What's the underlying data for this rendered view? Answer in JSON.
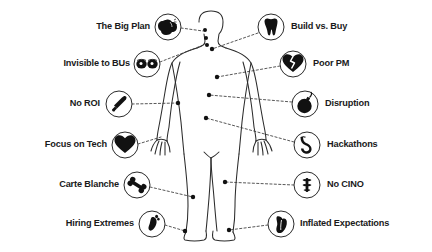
{
  "diagram": {
    "style": {
      "background": "#ffffff",
      "ink": "#1a1a1a",
      "body_outline": "#2b2b2b",
      "connector": "#3a3a3a",
      "icon_fill": "#111111",
      "icon_ring": "#2b2b2b"
    },
    "body": {
      "name": "human-figure-silhouette",
      "anchor_points": [
        {
          "id": "head-top",
          "x": 205,
          "y": 30
        },
        {
          "id": "head-mid",
          "x": 206,
          "y": 38
        },
        {
          "id": "head-low",
          "x": 207,
          "y": 46
        },
        {
          "id": "neck",
          "x": 212,
          "y": 48
        },
        {
          "id": "chest-left",
          "x": 217,
          "y": 76
        },
        {
          "id": "chest-right",
          "x": 208,
          "y": 95
        },
        {
          "id": "abdomen",
          "x": 205,
          "y": 117
        },
        {
          "id": "arm-left",
          "x": 179,
          "y": 103
        },
        {
          "id": "hip",
          "x": 224,
          "y": 182
        },
        {
          "id": "knee-left",
          "x": 194,
          "y": 197
        },
        {
          "id": "ankle-left",
          "x": 186,
          "y": 231
        },
        {
          "id": "ankle-right",
          "x": 228,
          "y": 230
        }
      ]
    },
    "items_left": [
      {
        "id": "the-big-plan",
        "label": "The Big Plan",
        "icon": "brain-icon",
        "icon_cx": 168,
        "icon_cy": 27,
        "label_x": 150,
        "label_y": 23,
        "anchor": "head-top"
      },
      {
        "id": "invisible-to-bus",
        "label": "Invisible to BUs",
        "icon": "eyes-icon",
        "icon_cx": 147,
        "icon_cy": 64,
        "label_x": 130,
        "label_y": 60,
        "anchor": "head-low"
      },
      {
        "id": "no-roi",
        "label": "No ROI",
        "icon": "bone-pen-icon",
        "icon_cx": 119,
        "icon_cy": 104,
        "label_x": 100,
        "label_y": 100,
        "anchor": "arm-left"
      },
      {
        "id": "focus-on-tech",
        "label": "Focus on Tech",
        "icon": "heart-icon",
        "icon_cx": 125,
        "icon_cy": 145,
        "label_x": 106,
        "label_y": 141,
        "anchor": "hand-left"
      },
      {
        "id": "carte-blanche",
        "label": "Carte Blanche",
        "icon": "bone-icon",
        "icon_cx": 137,
        "icon_cy": 185,
        "label_x": 118,
        "label_y": 181,
        "anchor": "knee-left"
      },
      {
        "id": "hiring-extremes",
        "label": "Hiring Extremes",
        "icon": "footprint-icon",
        "icon_cx": 152,
        "icon_cy": 224,
        "label_x": 133,
        "label_y": 220,
        "anchor": "ankle-left"
      }
    ],
    "items_right": [
      {
        "id": "build-vs-buy",
        "label": "Build vs. Buy",
        "icon": "tooth-icon",
        "icon_cx": 271,
        "icon_cy": 27,
        "label_x": 291,
        "label_y": 23,
        "anchor": "head-mid"
      },
      {
        "id": "poor-pm",
        "label": "Poor PM",
        "icon": "broken-heart-icon",
        "icon_cx": 293,
        "icon_cy": 64,
        "label_x": 313,
        "label_y": 60,
        "anchor": "chest-left"
      },
      {
        "id": "disruption",
        "label": "Disruption",
        "icon": "bomb-icon",
        "icon_cx": 305,
        "icon_cy": 104,
        "label_x": 325,
        "label_y": 100,
        "anchor": "chest-right"
      },
      {
        "id": "hackathons",
        "label": "Hackathons",
        "icon": "stomach-icon",
        "icon_cx": 307,
        "icon_cy": 145,
        "label_x": 327,
        "label_y": 141,
        "anchor": "abdomen"
      },
      {
        "id": "no-cino",
        "label": "No CINO",
        "icon": "spine-icon",
        "icon_cx": 307,
        "icon_cy": 185,
        "label_x": 327,
        "label_y": 181,
        "anchor": "hip"
      },
      {
        "id": "inflated-expectations",
        "label": "Inflated Expectations",
        "icon": "lung-foot-icon",
        "icon_cx": 281,
        "icon_cy": 224,
        "label_x": 301,
        "label_y": 220,
        "anchor": "ankle-right"
      }
    ]
  }
}
